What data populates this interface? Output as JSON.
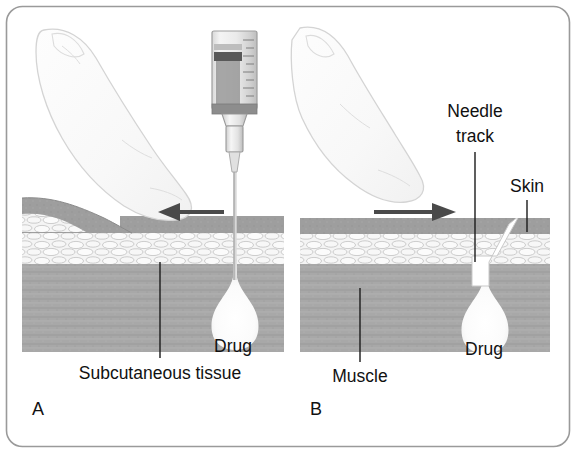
{
  "figure": {
    "frame_color": "#9a9a9a",
    "background_color": "#ffffff"
  },
  "palette": {
    "skin_layer": "#9c9c9c",
    "subcutaneous_layer": "#f2f2f2",
    "subcutaneous_outline": "#b8b8b8",
    "muscle_layer": "#a8a8a8",
    "drug_pool": "#fbfbfb",
    "needle_track": "#ffffff",
    "arrow": "#4a4a4a",
    "finger_fill": "#fafafa",
    "finger_outline": "#d2d2d2",
    "syringe_body": "#e9e9e9",
    "syringe_plunger": "#6e6e6e",
    "text": "#111111"
  },
  "panels": [
    {
      "id": "A",
      "letter": "A",
      "arrow_direction": "left",
      "arrow_name": "skin-displacement-arrow-left",
      "labels": [
        {
          "name": "drug-label",
          "text": "Drug"
        },
        {
          "name": "subcutaneous-tissue-label",
          "text": "Subcutaneous tissue"
        }
      ],
      "elements": [
        "finger-pressing-skin",
        "syringe",
        "needle",
        "skin-layer",
        "subcutaneous-layer",
        "muscle-layer",
        "drug-deposit"
      ]
    },
    {
      "id": "B",
      "letter": "B",
      "arrow_direction": "right",
      "arrow_name": "skin-release-arrow-right",
      "labels": [
        {
          "name": "needle-track-label-line1",
          "text": "Needle"
        },
        {
          "name": "needle-track-label-line2",
          "text": "track"
        },
        {
          "name": "skin-label",
          "text": "Skin"
        },
        {
          "name": "drug-label",
          "text": "Drug"
        },
        {
          "name": "muscle-label",
          "text": "Muscle"
        }
      ],
      "elements": [
        "finger-lifted",
        "needle-track-zigzag",
        "skin-layer",
        "subcutaneous-layer",
        "muscle-layer",
        "drug-deposit"
      ]
    }
  ],
  "labels": {
    "panel_a_letter": "A",
    "panel_b_letter": "B",
    "drug_a": "Drug",
    "drug_b": "Drug",
    "subcutaneous_tissue": "Subcutaneous tissue",
    "muscle": "Muscle",
    "needle_track_line1": "Needle",
    "needle_track_line2": "track",
    "skin": "Skin"
  }
}
